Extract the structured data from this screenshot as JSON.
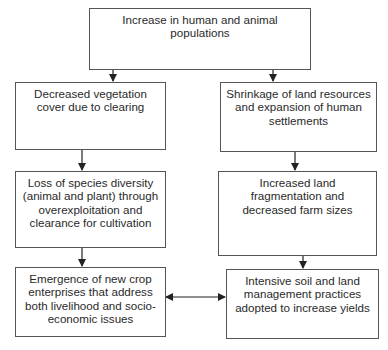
{
  "diagram": {
    "nodes": [
      {
        "id": "top",
        "label": "Increase in human and animal populations"
      },
      {
        "id": "left1",
        "label": "Decreased vegetation cover due to clearing"
      },
      {
        "id": "left2",
        "label": "Loss of species diversity (animal and plant) through overexploitation and clearance for cultivation"
      },
      {
        "id": "left3",
        "label": "Emergence of new crop enterprises that address both livelihood and socio-economic issues"
      },
      {
        "id": "right1",
        "label": "Shrinkage of land resources and expansion of human settlements"
      },
      {
        "id": "right2",
        "label": "Increased land fragmentation and decreased farm sizes"
      },
      {
        "id": "right3",
        "label": "Intensive soil and land management practices adopted to increase yields"
      }
    ],
    "edges": [
      {
        "from": "top",
        "to": "left1"
      },
      {
        "from": "top",
        "to": "right1"
      },
      {
        "from": "left1",
        "to": "left2"
      },
      {
        "from": "left2",
        "to": "left3"
      },
      {
        "from": "right1",
        "to": "right2"
      },
      {
        "from": "right2",
        "to": "right3"
      },
      {
        "from": "left3",
        "to": "right3",
        "bidirectional": true
      }
    ]
  }
}
